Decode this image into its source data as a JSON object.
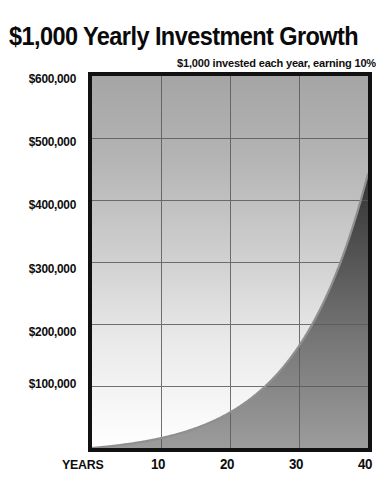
{
  "chart_data": {
    "type": "area",
    "title": "$1,000 Yearly Investment Growth",
    "subtitle": "$1,000 invested each year, earning 10%",
    "xlabel": "YEARS",
    "ylabel": "",
    "xlim": [
      0,
      40
    ],
    "ylim": [
      0,
      600000
    ],
    "grid": true,
    "legend": "none",
    "y_ticks": [
      {
        "value": 600000,
        "label": "$600,000"
      },
      {
        "value": 500000,
        "label": "$500,000"
      },
      {
        "value": 400000,
        "label": "$400,000"
      },
      {
        "value": 300000,
        "label": "$300,000"
      },
      {
        "value": 200000,
        "label": "$200,000"
      },
      {
        "value": 100000,
        "label": "$100,000"
      }
    ],
    "x_ticks": [
      {
        "value": 10,
        "label": "10"
      },
      {
        "value": 20,
        "label": "20"
      },
      {
        "value": 30,
        "label": "30"
      },
      {
        "value": 40,
        "label": "40"
      }
    ],
    "series": [
      {
        "name": "Accumulated value",
        "x": [
          0,
          2,
          4,
          6,
          8,
          10,
          12,
          14,
          16,
          18,
          20,
          22,
          24,
          26,
          28,
          30,
          32,
          34,
          36,
          38,
          40
        ],
        "values": [
          0,
          2100,
          4641,
          7716,
          11436,
          15937,
          21384,
          27975,
          35950,
          45599,
          57275,
          71403,
          88497,
          109182,
          134210,
          164494,
          201138,
          245477,
          299127,
          364043,
          442593
        ]
      }
    ],
    "fill_colors": {
      "above_curve_top": "#a8a8a8",
      "above_curve_bottom": "#ffffff",
      "below_curve_top": "#141414",
      "below_curve_bottom": "#9a9a9a",
      "curve_edge": "#8a8a8a",
      "border": "#111111",
      "gridline": "#5a5a5a",
      "text": "#0d0d0d"
    }
  }
}
